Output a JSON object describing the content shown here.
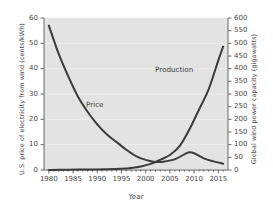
{
  "chart_data": {
    "type": "line",
    "title": "",
    "xlabel": "Year",
    "ylabel_left": "U.S. price of electricity from wind (cents/kWh)",
    "ylabel_right": "Global wind power capacity (gigawatts)",
    "xlim": [
      1979,
      2017
    ],
    "ylim_left": [
      0,
      60
    ],
    "ylim_right": [
      0,
      600
    ],
    "xticks": [
      "1980",
      "1985",
      "1990",
      "1995",
      "2000",
      "2005",
      "2010",
      "2015"
    ],
    "xtick_values": [
      1980,
      1985,
      1990,
      1995,
      2000,
      2005,
      2010,
      2015
    ],
    "yticks_left": [
      "0",
      "10",
      "20",
      "30",
      "40",
      "50",
      "60"
    ],
    "ytick_left_values": [
      0,
      10,
      20,
      30,
      40,
      50,
      60
    ],
    "yticks_right": [
      "0",
      "50",
      "100",
      "150",
      "200",
      "250",
      "300",
      "350",
      "400",
      "450",
      "500",
      "550",
      "600"
    ],
    "ytick_right_values": [
      0,
      50,
      100,
      150,
      200,
      250,
      300,
      350,
      400,
      450,
      500,
      550,
      600
    ],
    "grid": true,
    "legend_position": "inline-annotations",
    "plot_background": "#e3e3e3",
    "line_color": "#3b3b3b",
    "series": [
      {
        "name": "Price",
        "axis": "left",
        "units": "cents/kWh",
        "label_text": "Price",
        "x": [
          1980,
          1982,
          1984,
          1986,
          1988,
          1990,
          1992,
          1994,
          1996,
          1998,
          2000,
          2002,
          2004,
          2006,
          2008,
          2009,
          2010,
          2012,
          2014,
          2016
        ],
        "values": [
          57,
          46,
          37,
          29,
          23,
          18,
          14,
          11,
          8,
          5.5,
          4,
          3.2,
          3.4,
          4.2,
          6.2,
          7.0,
          6.6,
          4.6,
          3.4,
          2.5
        ]
      },
      {
        "name": "Production",
        "axis": "right",
        "units": "gigawatts",
        "label_text": "Production",
        "x": [
          1980,
          1984,
          1988,
          1992,
          1995,
          1997,
          1999,
          2001,
          2003,
          2005,
          2007,
          2009,
          2011,
          2013,
          2015,
          2016
        ],
        "values": [
          0,
          1,
          2,
          3,
          5,
          8,
          14,
          24,
          40,
          59,
          94,
          159,
          238,
          318,
          433,
          487
        ]
      }
    ],
    "annotations": [
      {
        "text": "Price",
        "x": 1991,
        "y_left": 21
      },
      {
        "text": "Production",
        "x": 2007,
        "y_right": 360
      }
    ]
  }
}
